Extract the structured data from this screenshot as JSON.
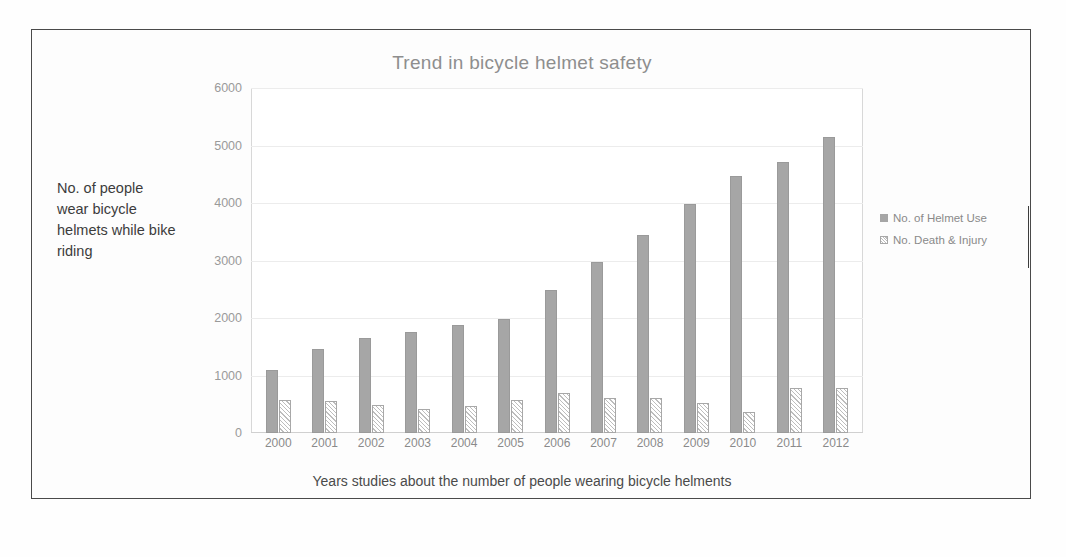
{
  "document": {
    "frame_color": "#4a4a4a",
    "background": "#fefefe"
  },
  "chart_data": {
    "type": "bar",
    "title": "Trend in bicycle helmet safety",
    "xlabel": "Years studies about the number of people wearing bicycle helments",
    "ylabel": "No. of people wear bicycle helmets while bike riding",
    "categories": [
      "2000",
      "2001",
      "2002",
      "2003",
      "2004",
      "2005",
      "2006",
      "2007",
      "2008",
      "2009",
      "2010",
      "2011",
      "2012"
    ],
    "series": [
      {
        "name": "No. of Helmet Use",
        "color": "#a6a6a6",
        "values": [
          1100,
          1460,
          1650,
          1760,
          1880,
          1990,
          2490,
          2970,
          3450,
          3980,
          4470,
          4710,
          5150
        ]
      },
      {
        "name": "No. Death & Injury",
        "color": "#ffffff",
        "pattern": "diagonal-hatch",
        "values": [
          570,
          560,
          480,
          420,
          470,
          570,
          690,
          610,
          610,
          520,
          370,
          790,
          780
        ]
      }
    ],
    "ylim": [
      0,
      6000
    ],
    "yticks": [
      0,
      1000,
      2000,
      3000,
      4000,
      5000,
      6000
    ],
    "ytick_labels": [
      "0",
      "1000",
      "2000",
      "3000",
      "4000",
      "5000",
      "6000"
    ],
    "grid": true,
    "grid_color": "#ececec",
    "legend_position": "right",
    "title_color": "#8e8e8e",
    "tick_color": "#8a8a8a"
  }
}
